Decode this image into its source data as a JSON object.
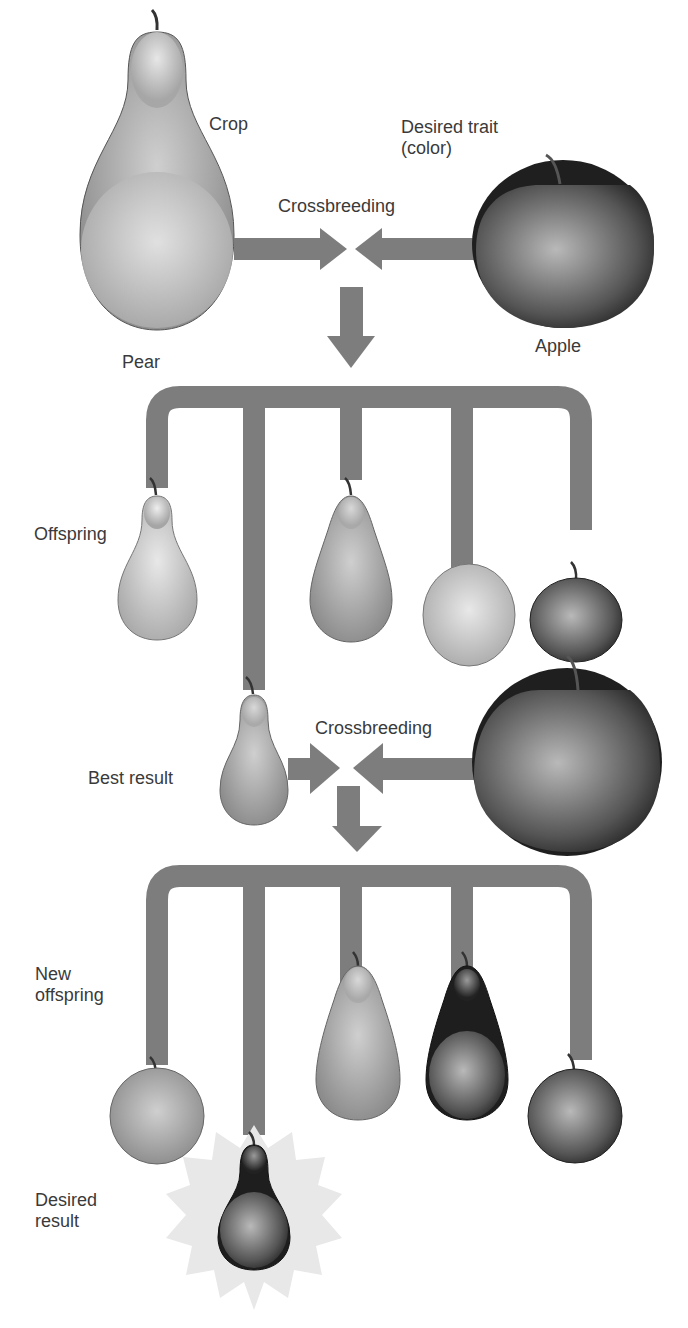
{
  "colors": {
    "connector": "#7d7d7d",
    "text": "#3a3a3a",
    "background": "#ffffff",
    "pear_light": "#c8c8c8",
    "apple_dark": "#2a2a2a",
    "burst": "#e6e6e6"
  },
  "labels": {
    "crop": "Crop",
    "desired_trait": "Desired trait\n(color)",
    "crossbreeding_1": "Crossbreeding",
    "pear": "Pear",
    "apple": "Apple",
    "offspring": "Offspring",
    "crossbreeding_2": "Crossbreeding",
    "best_result": "Best result",
    "new_offspring": "New\noffspring",
    "desired_result": "Desired\nresult"
  },
  "stages": [
    {
      "name": "parents",
      "items": [
        "pear (crop)",
        "apple (desired trait: color)"
      ]
    },
    {
      "name": "offspring",
      "items": [
        "light slim pear",
        "medium teardrop pear",
        "light apple",
        "dark apple"
      ]
    },
    {
      "name": "second cross",
      "items": [
        "best result pear",
        "apple"
      ]
    },
    {
      "name": "new offspring",
      "items": [
        "medium apple",
        "medium teardrop pear",
        "dark teardrop pear",
        "dark apple"
      ]
    },
    {
      "name": "desired result",
      "items": [
        "dark pear"
      ]
    }
  ]
}
